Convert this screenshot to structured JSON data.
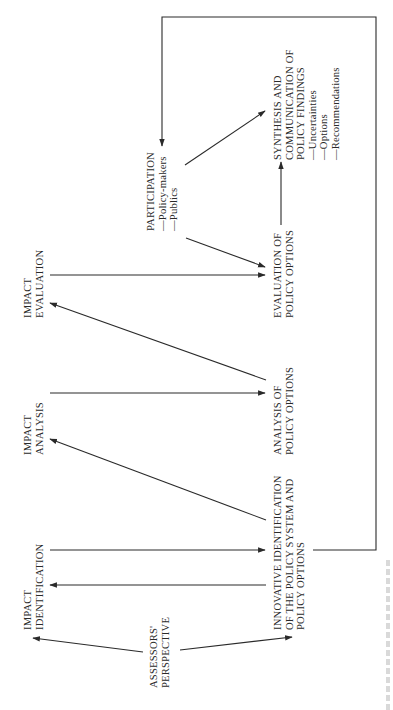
{
  "diagram": {
    "orientation": "rotated-90-ccw",
    "nodes": {
      "assessors_perspective": {
        "lines": [
          "ASSESSORS'",
          "PERSPECTIVE"
        ]
      },
      "impact_identification": {
        "lines": [
          "IMPACT",
          "IDENTIFICATION"
        ]
      },
      "impact_analysis": {
        "lines": [
          "IMPACT",
          "ANALYSIS"
        ]
      },
      "impact_evaluation": {
        "lines": [
          "IMPACT",
          "EVALUATION"
        ]
      },
      "innovative_identification": {
        "lines": [
          "INNOVATIVE IDENTIFICATION",
          "OF THE POLICY SYSTEM AND",
          "POLICY OPTIONS"
        ]
      },
      "analysis_policy_options": {
        "lines": [
          "ANALYSIS OF",
          "POLICY OPTIONS"
        ]
      },
      "evaluation_policy_options": {
        "lines": [
          "EVALUATION OF",
          "POLICY OPTIONS"
        ]
      },
      "participation": {
        "lines": [
          "PARTICIPATION",
          "—Policy-makers",
          "—Publics"
        ]
      },
      "synthesis": {
        "lines": [
          "SYNTHESIS  AND",
          "COMMUNICATION OF",
          "POLICY FINDINGS",
          "—Uncertainties",
          "—Options",
          "—Recommendations"
        ]
      }
    },
    "edges": [
      {
        "from": "Assessors' Perspective",
        "to": "Impact Identification"
      },
      {
        "from": "Assessors' Perspective",
        "to": "Innovative Identification of the Policy System and Policy Options"
      },
      {
        "from": "Impact Identification",
        "to": "Innovative Identification of the Policy System and Policy Options"
      },
      {
        "from": "Innovative Identification of the Policy System and Policy Options",
        "to": "Impact Identification"
      },
      {
        "from": "Innovative Identification of the Policy System and Policy Options",
        "to": "Impact Analysis"
      },
      {
        "from": "Impact Analysis",
        "to": "Analysis of Policy Options"
      },
      {
        "from": "Analysis of Policy Options",
        "to": "Impact Evaluation"
      },
      {
        "from": "Impact Evaluation",
        "to": "Evaluation of Policy Options"
      },
      {
        "from": "Participation",
        "to": "Evaluation of Policy Options"
      },
      {
        "from": "Evaluation of Policy Options",
        "to": "Synthesis and Communication of Policy Findings"
      },
      {
        "from": "Participation",
        "to": "Synthesis and Communication of Policy Findings"
      },
      {
        "from": "Innovative Identification of the Policy System and Policy Options",
        "to": "Participation",
        "style": "feedback-loop"
      }
    ],
    "colors": {
      "ink": "#2a2a2a",
      "background": "#ffffff"
    }
  }
}
